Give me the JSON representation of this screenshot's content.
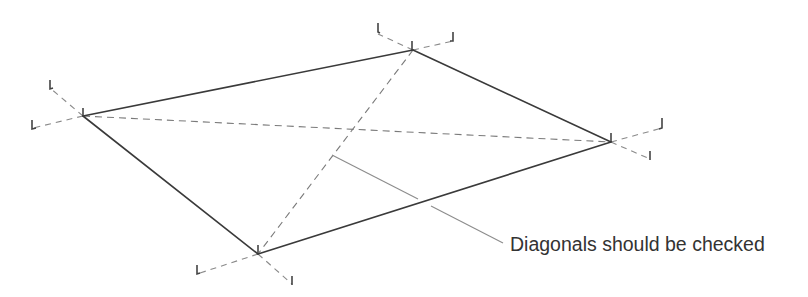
{
  "diagram": {
    "type": "technical-illustration",
    "annotation": {
      "label": "Diagonals should be checked"
    },
    "colors": {
      "edge": "#3a3a3a",
      "diagonal": "#7a7a7a",
      "extension": "#8a8a8a",
      "leader": "#8c8c8c",
      "text": "#333333",
      "background": "#ffffff"
    },
    "corners": [
      {
        "id": "A",
        "position": "left",
        "x": 83,
        "y": 116
      },
      {
        "id": "B",
        "position": "top",
        "x": 413,
        "y": 50
      },
      {
        "id": "C",
        "position": "right",
        "x": 611,
        "y": 142
      },
      {
        "id": "D",
        "position": "bottom",
        "x": 258,
        "y": 254
      }
    ],
    "edges": [
      "A-B",
      "B-C",
      "C-D",
      "D-A"
    ],
    "diagonals": [
      "A-C",
      "B-D"
    ]
  }
}
